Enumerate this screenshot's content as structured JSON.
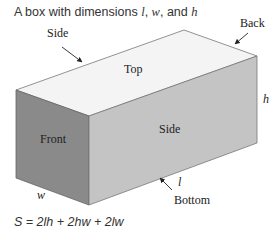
{
  "title": {
    "prefix": "A box with dimensions ",
    "l": "l",
    "sep1": ", ",
    "w": "w",
    "sep2": ", and ",
    "h": "h"
  },
  "labels": {
    "side_top": "Side",
    "back": "Back",
    "top": "Top",
    "front": "Front",
    "side": "Side",
    "bottom": "Bottom",
    "h": "h",
    "l": "l",
    "w": "w"
  },
  "formula": "S = 2lh + 2hw + 2lw",
  "colors": {
    "top_face": "#f4f4f4",
    "front_face": "#8a8a8a",
    "side_face": "#c4c4c4",
    "edge": "#666666"
  }
}
